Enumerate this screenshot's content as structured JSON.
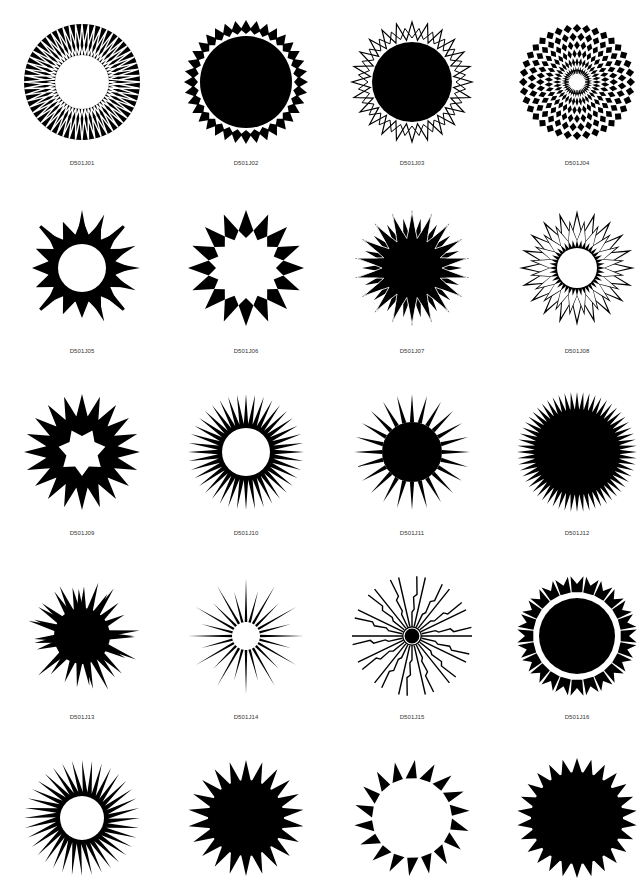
{
  "page": {
    "background": "#ffffff",
    "ink": "#000000"
  },
  "rows_y": [
    82,
    268,
    452,
    636,
    818
  ],
  "cols_x": [
    82,
    246,
    412,
    577
  ],
  "label_offsets": [
    78,
    80,
    78,
    78,
    0
  ],
  "items": [
    {
      "code": "D501J01",
      "type": "ring-zigzag",
      "r": 58,
      "inner": 27,
      "n": 28
    },
    {
      "code": "D501J02",
      "type": "gear-notch",
      "r": 62,
      "inner": 45,
      "n": 36
    },
    {
      "code": "D501J03",
      "type": "disc-zigzag",
      "r": 60,
      "inner": 40,
      "n": 24
    },
    {
      "code": "D501J04",
      "type": "checker-rays",
      "r": 58,
      "inner": 8,
      "n": 36
    },
    {
      "code": "D501J05",
      "type": "sun-spikes",
      "r": 58,
      "inner": 24,
      "n": 16
    },
    {
      "code": "D501J06",
      "type": "diamond-ring",
      "r": 58,
      "inner": 30,
      "n": 16
    },
    {
      "code": "D501J07",
      "type": "star-overlap",
      "r": 58,
      "inner": 22,
      "n": 18
    },
    {
      "code": "D501J08",
      "type": "ring-star-outline",
      "r": 58,
      "inner": 18,
      "n": 20
    },
    {
      "code": "D501J09",
      "type": "scallop-star",
      "r": 58,
      "inner": 20,
      "n": 20
    },
    {
      "code": "D501J10",
      "type": "ring-spikes",
      "r": 58,
      "inner": 24,
      "n": 40
    },
    {
      "code": "D501J11",
      "type": "disc-thin-spikes",
      "r": 58,
      "inner": 30,
      "n": 24
    },
    {
      "code": "D501J12",
      "type": "disc-fine-spikes",
      "r": 60,
      "inner": 42,
      "n": 60
    },
    {
      "code": "D501J13",
      "type": "burst-random",
      "r": 60,
      "inner": 25,
      "n": 32
    },
    {
      "code": "D501J14",
      "type": "burst-ring",
      "r": 58,
      "inner": 10,
      "n": 24
    },
    {
      "code": "D501J15",
      "type": "lightning-rays",
      "r": 60,
      "inner": 6,
      "n": 28
    },
    {
      "code": "D501J16",
      "type": "disc-detached-teeth",
      "r": 60,
      "inner": 38,
      "n": 24
    },
    {
      "code": "",
      "type": "swirl-spikes",
      "r": 58,
      "inner": 20,
      "n": 36
    },
    {
      "code": "",
      "type": "solid-star",
      "r": 58,
      "inner": 30,
      "n": 22
    },
    {
      "code": "",
      "type": "ring-triangles",
      "r": 58,
      "inner": 38,
      "n": 18
    },
    {
      "code": "",
      "type": "solid-star-2",
      "r": 60,
      "inner": 40,
      "n": 26
    }
  ]
}
